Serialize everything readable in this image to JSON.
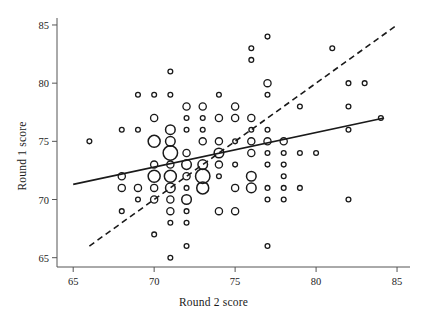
{
  "figure": {
    "background": "#ffffff",
    "ink": "#1a1a1a"
  },
  "axes": {
    "x_title": "Round 2 score",
    "y_title": "Round 1 score",
    "x_ticks": [
      65,
      70,
      75,
      80,
      85
    ],
    "y_ticks": [
      65,
      70,
      75,
      80,
      85
    ],
    "x_tick_labels": [
      "65",
      "70",
      "75",
      "80",
      "85"
    ],
    "y_tick_labels": [
      "65",
      "70",
      "75",
      "80",
      "85"
    ],
    "xlim": [
      64.0,
      85.8
    ],
    "ylim": [
      64.2,
      85.6
    ],
    "grid": false
  },
  "chart_data": {
    "type": "scatter",
    "title": "",
    "xlabel": "Round 2 score",
    "ylabel": "Round 1 score",
    "xlim": [
      64.0,
      85.8
    ],
    "ylim": [
      64.2,
      85.6
    ],
    "grid": false,
    "legend": null,
    "marker": {
      "shape": "open-circle",
      "fill": "none",
      "stroke": "#1a1a1a",
      "size_encodes": "count of overlapping observations",
      "radius_by_count": {
        "1": 2.4,
        "2": 3.6,
        "3": 4.8,
        "4": 6.0,
        "5": 7.2
      }
    },
    "points": [
      {
        "x": 66,
        "y": 75,
        "n": 1
      },
      {
        "x": 68,
        "y": 76,
        "n": 1
      },
      {
        "x": 68,
        "y": 72,
        "n": 2
      },
      {
        "x": 68,
        "y": 71,
        "n": 2
      },
      {
        "x": 68,
        "y": 69,
        "n": 1
      },
      {
        "x": 69,
        "y": 79,
        "n": 1
      },
      {
        "x": 69,
        "y": 76,
        "n": 1
      },
      {
        "x": 69,
        "y": 71,
        "n": 2
      },
      {
        "x": 69,
        "y": 70,
        "n": 1
      },
      {
        "x": 70,
        "y": 79,
        "n": 1
      },
      {
        "x": 70,
        "y": 77,
        "n": 2
      },
      {
        "x": 70,
        "y": 75,
        "n": 4
      },
      {
        "x": 70,
        "y": 73,
        "n": 2
      },
      {
        "x": 70,
        "y": 72,
        "n": 4
      },
      {
        "x": 70,
        "y": 71,
        "n": 2
      },
      {
        "x": 70,
        "y": 70,
        "n": 2
      },
      {
        "x": 70,
        "y": 67,
        "n": 1
      },
      {
        "x": 71,
        "y": 79,
        "n": 1
      },
      {
        "x": 71,
        "y": 81,
        "n": 1
      },
      {
        "x": 71,
        "y": 76,
        "n": 3
      },
      {
        "x": 71,
        "y": 75,
        "n": 3
      },
      {
        "x": 71,
        "y": 74,
        "n": 5
      },
      {
        "x": 71,
        "y": 73,
        "n": 2
      },
      {
        "x": 71,
        "y": 72,
        "n": 4
      },
      {
        "x": 71,
        "y": 71,
        "n": 3
      },
      {
        "x": 71,
        "y": 70,
        "n": 2
      },
      {
        "x": 71,
        "y": 69,
        "n": 2
      },
      {
        "x": 71,
        "y": 68,
        "n": 1
      },
      {
        "x": 71,
        "y": 65,
        "n": 1
      },
      {
        "x": 72,
        "y": 78,
        "n": 2
      },
      {
        "x": 72,
        "y": 77,
        "n": 1
      },
      {
        "x": 72,
        "y": 76,
        "n": 1
      },
      {
        "x": 72,
        "y": 74,
        "n": 2
      },
      {
        "x": 72,
        "y": 73,
        "n": 3
      },
      {
        "x": 72,
        "y": 72,
        "n": 2
      },
      {
        "x": 72,
        "y": 71,
        "n": 1
      },
      {
        "x": 72,
        "y": 70,
        "n": 3
      },
      {
        "x": 72,
        "y": 69,
        "n": 1
      },
      {
        "x": 72,
        "y": 68,
        "n": 1
      },
      {
        "x": 72,
        "y": 66,
        "n": 1
      },
      {
        "x": 73,
        "y": 78,
        "n": 2
      },
      {
        "x": 73,
        "y": 77,
        "n": 1
      },
      {
        "x": 73,
        "y": 76,
        "n": 1
      },
      {
        "x": 73,
        "y": 75,
        "n": 2
      },
      {
        "x": 73,
        "y": 73,
        "n": 3
      },
      {
        "x": 73,
        "y": 72,
        "n": 5
      },
      {
        "x": 73,
        "y": 71,
        "n": 4
      },
      {
        "x": 74,
        "y": 79,
        "n": 1
      },
      {
        "x": 74,
        "y": 77,
        "n": 2
      },
      {
        "x": 74,
        "y": 75,
        "n": 2
      },
      {
        "x": 74,
        "y": 74,
        "n": 3
      },
      {
        "x": 74,
        "y": 73,
        "n": 2
      },
      {
        "x": 74,
        "y": 72,
        "n": 1
      },
      {
        "x": 74,
        "y": 69,
        "n": 2
      },
      {
        "x": 75,
        "y": 78,
        "n": 2
      },
      {
        "x": 75,
        "y": 77,
        "n": 2
      },
      {
        "x": 75,
        "y": 75,
        "n": 1
      },
      {
        "x": 75,
        "y": 73,
        "n": 1
      },
      {
        "x": 75,
        "y": 71,
        "n": 2
      },
      {
        "x": 75,
        "y": 69,
        "n": 2
      },
      {
        "x": 76,
        "y": 83,
        "n": 1
      },
      {
        "x": 76,
        "y": 82,
        "n": 1
      },
      {
        "x": 76,
        "y": 77,
        "n": 2
      },
      {
        "x": 76,
        "y": 76,
        "n": 1
      },
      {
        "x": 76,
        "y": 75,
        "n": 2
      },
      {
        "x": 76,
        "y": 74,
        "n": 2
      },
      {
        "x": 76,
        "y": 72,
        "n": 3
      },
      {
        "x": 76,
        "y": 71,
        "n": 3
      },
      {
        "x": 77,
        "y": 84,
        "n": 1
      },
      {
        "x": 77,
        "y": 80,
        "n": 2
      },
      {
        "x": 77,
        "y": 79,
        "n": 1
      },
      {
        "x": 77,
        "y": 76,
        "n": 1
      },
      {
        "x": 77,
        "y": 75,
        "n": 2
      },
      {
        "x": 77,
        "y": 74,
        "n": 1
      },
      {
        "x": 77,
        "y": 73,
        "n": 1
      },
      {
        "x": 77,
        "y": 71,
        "n": 1
      },
      {
        "x": 77,
        "y": 70,
        "n": 1
      },
      {
        "x": 77,
        "y": 66,
        "n": 1
      },
      {
        "x": 78,
        "y": 75,
        "n": 2
      },
      {
        "x": 78,
        "y": 74,
        "n": 1
      },
      {
        "x": 78,
        "y": 73,
        "n": 1
      },
      {
        "x": 78,
        "y": 72,
        "n": 1
      },
      {
        "x": 78,
        "y": 71,
        "n": 1
      },
      {
        "x": 78,
        "y": 70,
        "n": 1
      },
      {
        "x": 79,
        "y": 78,
        "n": 1
      },
      {
        "x": 79,
        "y": 74,
        "n": 1
      },
      {
        "x": 79,
        "y": 71,
        "n": 1
      },
      {
        "x": 80,
        "y": 74,
        "n": 1
      },
      {
        "x": 81,
        "y": 83,
        "n": 1
      },
      {
        "x": 82,
        "y": 80,
        "n": 1
      },
      {
        "x": 82,
        "y": 78,
        "n": 1
      },
      {
        "x": 82,
        "y": 76,
        "n": 1
      },
      {
        "x": 82,
        "y": 70,
        "n": 1
      },
      {
        "x": 83,
        "y": 80,
        "n": 1
      },
      {
        "x": 84,
        "y": 77,
        "n": 1
      }
    ],
    "lines": [
      {
        "name": "regression-line",
        "style": "solid",
        "stroke": "#1a1a1a",
        "width": 1.6,
        "x_start": 65.0,
        "y_start": 71.3,
        "x_end": 84.2,
        "y_end": 77.0
      },
      {
        "name": "identity-line",
        "style": "dashed",
        "stroke": "#1a1a1a",
        "width": 1.6,
        "dash": "6 4",
        "x_start": 66.0,
        "y_start": 66.0,
        "x_end": 85.0,
        "y_end": 85.0
      }
    ]
  }
}
